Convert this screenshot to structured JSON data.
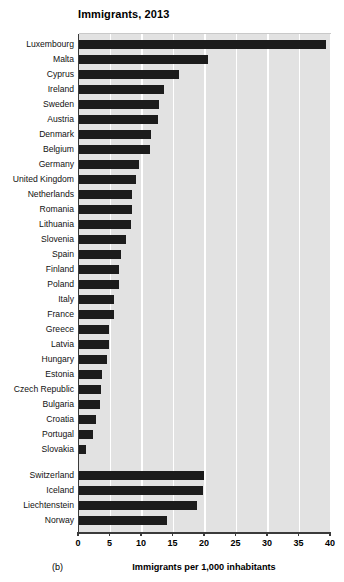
{
  "chart_data": {
    "type": "bar",
    "orientation": "horizontal",
    "title": "Immigrants, 2013",
    "panel_label": "(b)",
    "xlabel": "Immigrants per 1,000 inhabitants",
    "ylabel": "",
    "xlim": [
      0,
      40
    ],
    "xticks": [
      0,
      5,
      10,
      15,
      20,
      25,
      30,
      35,
      40
    ],
    "xtick_labels": [
      "0",
      "5",
      "10",
      "15",
      "20",
      "25",
      "30",
      "35",
      "40"
    ],
    "grid": "vertical-white-gridlines",
    "legend": "none",
    "bar_color": "#1c1c1c",
    "plot_background": "#e2e2e2",
    "categories": [
      "Luxembourg",
      "Malta",
      "Cyprus",
      "Ireland",
      "Sweden",
      "Austria",
      "Denmark",
      "Belgium",
      "Germany",
      "United Kingdom",
      "Netherlands",
      "Romania",
      "Lithuania",
      "Slovenia",
      "Spain",
      "Finland",
      "Poland",
      "Italy",
      "France",
      "Greece",
      "Latvia",
      "Hungary",
      "Estonia",
      "Czech Republic",
      "Bulgaria",
      "Croatia",
      "Portugal",
      "Slovakia",
      "Switzerland",
      "Iceland",
      "Liechtenstein",
      "Norway"
    ],
    "values": [
      39.2,
      20.4,
      15.8,
      13.5,
      12.7,
      12.6,
      11.4,
      11.3,
      9.5,
      9.0,
      8.4,
      8.4,
      8.3,
      7.4,
      6.7,
      6.3,
      6.3,
      5.6,
      5.5,
      4.8,
      4.7,
      4.4,
      3.6,
      3.5,
      3.4,
      2.7,
      2.2,
      1.1,
      19.8,
      19.7,
      18.7,
      13.9
    ],
    "group_break_after_index": 27,
    "groups": [
      {
        "name": "EU member states",
        "start": 0,
        "end": 27
      },
      {
        "name": "EFTA / non-EU",
        "start": 28,
        "end": 31
      }
    ]
  }
}
